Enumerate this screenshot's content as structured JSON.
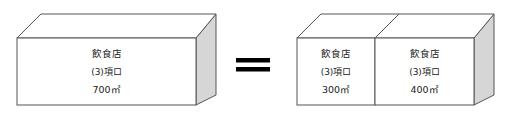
{
  "diagram": {
    "type": "equivalence-diagram",
    "equals_symbol": "=",
    "left": {
      "label": "left-block",
      "box": {
        "name": "飲食店",
        "clause": "(3)項ロ",
        "area": "700㎡"
      }
    },
    "right": {
      "label": "right-block-group",
      "boxes": [
        {
          "name": "飲食店",
          "clause": "(3)項ロ",
          "area": "300㎡"
        },
        {
          "name": "飲食店",
          "clause": "(3)項ロ",
          "area": "400㎡"
        }
      ]
    },
    "colors": {
      "outline": "#555555",
      "side_face": "#d6d6d6",
      "top_face": "#ffffff",
      "front_face": "#ffffff",
      "text": "#1a1a1a",
      "equals": "#000000",
      "background": "#ffffff"
    }
  }
}
